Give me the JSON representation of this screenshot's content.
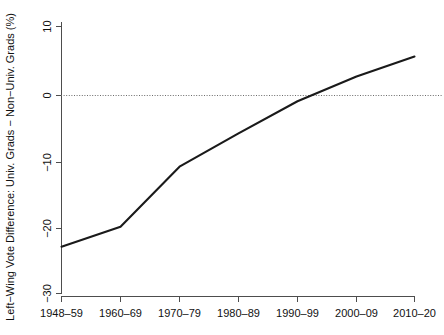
{
  "chart_data": {
    "type": "line",
    "title": "",
    "xlabel": "",
    "ylabel": "Left−Wing Vote Difference: Univ. Grads − Non−Univ. Grads (%)",
    "categories": [
      "1948–59",
      "1960–69",
      "1970–79",
      "1980–89",
      "1990–99",
      "2000–09",
      "2010–20"
    ],
    "values": [
      -23,
      -20,
      -11,
      -6,
      -1.2,
      2.5,
      5.5
    ],
    "xtick_labels": [
      "1948–59",
      "1960–69",
      "1970–79",
      "1980–89",
      "1990–99",
      "2000–09",
      "2010–20"
    ],
    "ytick_labels": [
      "10",
      "0",
      "−10",
      "−20",
      "−30"
    ],
    "ytick_values": [
      10,
      0,
      -10,
      -20,
      -30
    ],
    "ylim": [
      -30,
      10
    ],
    "grid": false,
    "legend": null,
    "annotations": [
      {
        "name": "zero-reference-line",
        "value": 0,
        "style": "dotted"
      }
    ],
    "series": [
      {
        "name": "Left-wing vote difference",
        "color": "#1a1a1a",
        "values": [
          -23,
          -20,
          -11,
          -6,
          -1.2,
          2.5,
          5.5
        ]
      }
    ]
  }
}
